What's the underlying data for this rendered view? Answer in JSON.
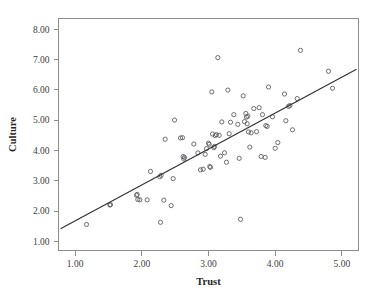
{
  "chart_data": {
    "type": "scatter",
    "title": "",
    "xlabel": "Trust",
    "ylabel": "Culture",
    "xlim": [
      0.75,
      5.25
    ],
    "ylim": [
      0.7,
      8.35
    ],
    "grid": false,
    "legend": null,
    "xticks": [
      1.0,
      2.0,
      3.0,
      4.0,
      5.0
    ],
    "xtick_labels": [
      "1.00",
      "2.00",
      "3.00",
      "4.00",
      "5.00"
    ],
    "yticks": [
      1.0,
      2.0,
      3.0,
      4.0,
      5.0,
      6.0,
      7.0,
      8.0
    ],
    "ytick_labels": [
      "1.00",
      "2.00",
      "3.00",
      "4.00",
      "5.00",
      "6.00",
      "7.00",
      "8.00"
    ],
    "marker": "open-circle",
    "marker_color": "#5d5d63",
    "fit_line": {
      "type": "linear-regression",
      "x_start": 0.78,
      "y_start": 1.42,
      "x_end": 5.22,
      "y_end": 6.68,
      "color": "#2e2e2e"
    },
    "points": [
      [
        1.17,
        1.56
      ],
      [
        1.52,
        2.2
      ],
      [
        1.53,
        2.21
      ],
      [
        1.92,
        2.52
      ],
      [
        1.93,
        2.55
      ],
      [
        1.94,
        2.38
      ],
      [
        1.97,
        2.37
      ],
      [
        2.08,
        2.37
      ],
      [
        2.13,
        3.31
      ],
      [
        2.27,
        3.13
      ],
      [
        2.29,
        3.18
      ],
      [
        2.28,
        1.63
      ],
      [
        2.33,
        2.36
      ],
      [
        2.35,
        4.37
      ],
      [
        2.44,
        2.18
      ],
      [
        2.47,
        3.07
      ],
      [
        2.49,
        5.0
      ],
      [
        2.58,
        4.41
      ],
      [
        2.61,
        4.42
      ],
      [
        2.62,
        3.8
      ],
      [
        2.63,
        3.72
      ],
      [
        2.64,
        3.77
      ],
      [
        2.78,
        4.21
      ],
      [
        2.84,
        3.92
      ],
      [
        2.88,
        3.36
      ],
      [
        2.92,
        3.38
      ],
      [
        2.95,
        3.87
      ],
      [
        2.97,
        4.06
      ],
      [
        3.0,
        4.24
      ],
      [
        3.01,
        4.2
      ],
      [
        3.02,
        3.47
      ],
      [
        3.03,
        3.44
      ],
      [
        3.05,
        5.93
      ],
      [
        3.06,
        4.54
      ],
      [
        3.08,
        4.09
      ],
      [
        3.09,
        4.13
      ],
      [
        3.1,
        4.49
      ],
      [
        3.12,
        4.52
      ],
      [
        3.14,
        7.06
      ],
      [
        3.16,
        4.5
      ],
      [
        3.18,
        3.81
      ],
      [
        3.2,
        4.94
      ],
      [
        3.24,
        3.92
      ],
      [
        3.27,
        3.61
      ],
      [
        3.29,
        5.99
      ],
      [
        3.31,
        4.55
      ],
      [
        3.33,
        4.93
      ],
      [
        3.38,
        5.18
      ],
      [
        3.44,
        4.86
      ],
      [
        3.46,
        3.74
      ],
      [
        3.48,
        1.73
      ],
      [
        3.52,
        5.8
      ],
      [
        3.54,
        4.95
      ],
      [
        3.56,
        5.22
      ],
      [
        3.57,
        5.1
      ],
      [
        3.58,
        4.88
      ],
      [
        3.59,
        5.13
      ],
      [
        3.6,
        4.61
      ],
      [
        3.62,
        4.11
      ],
      [
        3.64,
        4.58
      ],
      [
        3.68,
        5.38
      ],
      [
        3.72,
        4.62
      ],
      [
        3.76,
        5.41
      ],
      [
        3.79,
        3.8
      ],
      [
        3.81,
        5.18
      ],
      [
        3.85,
        3.77
      ],
      [
        3.86,
        4.82
      ],
      [
        3.88,
        4.79
      ],
      [
        3.9,
        6.09
      ],
      [
        3.96,
        5.11
      ],
      [
        4.0,
        4.07
      ],
      [
        4.04,
        4.26
      ],
      [
        4.14,
        5.86
      ],
      [
        4.16,
        4.98
      ],
      [
        4.2,
        5.45
      ],
      [
        4.22,
        5.48
      ],
      [
        4.26,
        4.68
      ],
      [
        4.33,
        5.71
      ],
      [
        4.38,
        7.3
      ],
      [
        4.8,
        6.61
      ],
      [
        4.86,
        6.05
      ]
    ]
  },
  "axes": {
    "x_title": "Trust",
    "y_title": "Culture"
  }
}
